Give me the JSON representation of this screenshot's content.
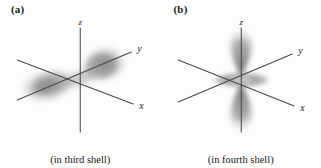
{
  "figure": {
    "background_color": "#fdfdfd",
    "axis_color": "#4a4a4a",
    "orbital_color": "#6e6e6e",
    "text_color": "#1c1c1c",
    "panels": [
      {
        "id": "a",
        "label": "(a)",
        "caption": "(in third shell)",
        "orbital_type": "p-orbital",
        "shell": "third shell",
        "axes": [
          {
            "name": "z",
            "label": "z",
            "orientation": "vertical-up"
          },
          {
            "name": "y",
            "label": "y",
            "orientation": "diagonal-upper-right"
          },
          {
            "name": "x",
            "label": "x",
            "orientation": "diagonal-lower-right"
          }
        ],
        "lobes": [
          {
            "name": "lobe-front-right",
            "direction": "upper-right"
          },
          {
            "name": "lobe-back-left",
            "direction": "lower-left"
          }
        ]
      },
      {
        "id": "b",
        "label": "(b)",
        "caption": "(in fourth shell)",
        "orbital_type": "d-z-squared-orbital",
        "shell": "fourth shell",
        "axes": [
          {
            "name": "z",
            "label": "z",
            "orientation": "vertical-up"
          },
          {
            "name": "y",
            "label": "y",
            "orientation": "diagonal-upper-right"
          },
          {
            "name": "x",
            "label": "x",
            "orientation": "diagonal-lower-right"
          }
        ],
        "lobes": [
          {
            "name": "lobe-top-z",
            "direction": "up"
          },
          {
            "name": "lobe-bottom-z",
            "direction": "down"
          },
          {
            "name": "torus-equatorial",
            "direction": "horizontal-ring"
          }
        ]
      }
    ]
  }
}
